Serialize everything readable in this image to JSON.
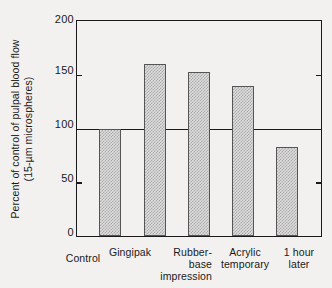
{
  "chart_data": {
    "type": "bar",
    "title": "",
    "subtitle": "",
    "xlabel": "",
    "ylabel": "Percent of control of pulpal blood flow (15-µm microspheres)",
    "ylabel_line1": "Percent of control of pulpal blood flow",
    "ylabel_line2": "(15-µm microspheres)",
    "categories": [
      "Control",
      "Gingipak",
      "Rubber-base impression",
      "Acrylic temporary",
      "1 hour later"
    ],
    "category_lines": [
      [
        "Control"
      ],
      [
        "Gingipak"
      ],
      [
        "Rubber-",
        "base",
        "impression"
      ],
      [
        "Acrylic",
        "temporary"
      ],
      [
        "1 hour",
        "later"
      ]
    ],
    "values": [
      100,
      160,
      153,
      140,
      83
    ],
    "ylim": [
      0,
      200
    ],
    "yticks": [
      0,
      50,
      100,
      150,
      200
    ],
    "ytick_labels": [
      "0",
      "50",
      "100",
      "150",
      "200"
    ],
    "reference_line": 100,
    "grid": false,
    "legend": "none",
    "bar_fill": "#dedede",
    "bar_hatch_color": "#a9a9a9",
    "bar_edge_color": "#555555",
    "axis_color": "#1a1a1a",
    "background_color": "#f2f1ef"
  },
  "axis": {
    "tick_200": "200",
    "tick_150": "150",
    "tick_100": "100",
    "tick_50": "50",
    "tick_0": "0"
  },
  "bars": {
    "control": {
      "label": "Control",
      "value": 100
    },
    "gingipak": {
      "label": "Gingipak",
      "value": 160
    },
    "rubber_base": {
      "label": "Rubber-base impression",
      "value": 153
    },
    "acrylic": {
      "label": "Acrylic temporary",
      "value": 140
    },
    "one_hour": {
      "label": "1 hour later",
      "value": 83
    }
  },
  "xlabels": {
    "control": "Control",
    "gingipak": "Gingipak",
    "rubber_l1": "Rubber-",
    "rubber_l2": "base",
    "rubber_l3": "impression",
    "acrylic_l1": "Acrylic",
    "acrylic_l2": "temporary",
    "hour_l1": "1 hour",
    "hour_l2": "later"
  }
}
